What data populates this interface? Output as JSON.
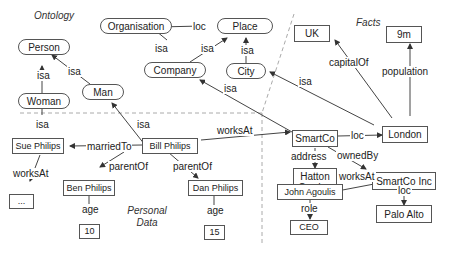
{
  "sections": {
    "ontology": "Ontology",
    "facts": "Facts",
    "personal_data_1": "Personal",
    "personal_data_2": "Data"
  },
  "classes": {
    "person": "Person",
    "woman": "Woman",
    "man": "Man",
    "organisation": "Organisation",
    "place": "Place",
    "company": "Company",
    "city": "City"
  },
  "entities": {
    "uk": "UK",
    "nine_m": "9m",
    "london": "London",
    "smartco": "SmartCo",
    "hatton_garden_1": "Hatton",
    "hatton_garden_2": "Garden",
    "smartco_inc": "SmartCo Inc",
    "john_agoulis": "John Agoulis",
    "ceo": "CEO",
    "palo_alto": "Palo Alto",
    "sue_philips": "Sue Philips",
    "bill_philips": "Bill Philips",
    "ben_philips": "Ben Philips",
    "dan_philips": "Dan Philips",
    "age_10": "10",
    "age_15": "15",
    "unknown": "..."
  },
  "edges": {
    "woman_isa_person": "isa",
    "man_isa_person": "isa",
    "org_loc_place": "loc",
    "company_isa_org": "isa",
    "company_isa_place": "isa",
    "city_isa_place": "isa",
    "smartco_isa_company": "isa",
    "london_isa_city": "isa",
    "london_capitalof_uk": "capitalOf",
    "london_population": "population",
    "smartco_loc_london": "loc",
    "smartco_address": "address",
    "smartco_ownedby": "ownedBy",
    "john_worksat": "worksAt",
    "smartcoinc_loc": "loc",
    "john_role": "role",
    "sue_isa_woman": "isa",
    "bill_isa_man": "isa",
    "bill_marriedto": "marriedTo",
    "bill_worksat": "worksAt",
    "sue_worksat": "worksAt",
    "bill_parentof_ben": "parentOf",
    "bill_parentof_dan": "parentOf",
    "ben_age": "age",
    "dan_age": "age"
  }
}
